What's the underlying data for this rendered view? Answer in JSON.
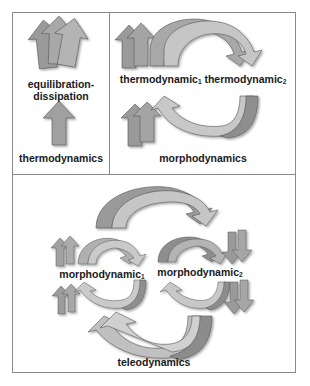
{
  "figure": {
    "panels": [
      {
        "id": "top-left",
        "labels": {
          "upper": "equilibration-dissipation",
          "upper_line1": "equilibration-",
          "upper_line2": "dissipation",
          "lower": "thermodynamics"
        }
      },
      {
        "id": "top-right",
        "labels": {
          "upper_part1": "thermodynamic",
          "upper_sub1": "1",
          "upper_part2": " thermodynamic",
          "upper_sub2": "2",
          "lower": "morphodynamics"
        }
      },
      {
        "id": "bottom",
        "labels": {
          "left_main": "morphodynamic",
          "left_sub": "1",
          "right_main": "morphodynamic",
          "right_sub": "2",
          "bottom": "teleodynamics"
        }
      }
    ],
    "colors": {
      "border": "#8a8a8a",
      "arrow_dark": "#8c8c8c",
      "arrow_mid": "#a6a6a6",
      "arrow_light": "#c8c8c8",
      "arrow_edge": "#555555",
      "text": "#1a1a1a"
    }
  }
}
